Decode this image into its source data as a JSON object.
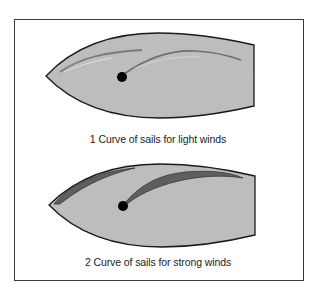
{
  "figure": {
    "diagrams": [
      {
        "id": 1,
        "caption": "1 Curve of sails for light winds",
        "wind_condition": "light winds",
        "sail_shape": "flat, thin"
      },
      {
        "id": 2,
        "caption": "2 Curve of sails for strong winds",
        "wind_condition": "strong winds",
        "sail_shape": "full, deep curve"
      }
    ],
    "colors": {
      "hull_fill": "#bdbdbd",
      "hull_outline": "#1a1a1a",
      "sail_light": "#7a7a7a",
      "sail_strong": "#5e5e5e",
      "mast": "#000000",
      "frame": "#3a3a3a"
    },
    "icons": [
      "boat-hull-icon",
      "mast-icon",
      "jib-sail-icon",
      "mainsail-icon"
    ]
  }
}
